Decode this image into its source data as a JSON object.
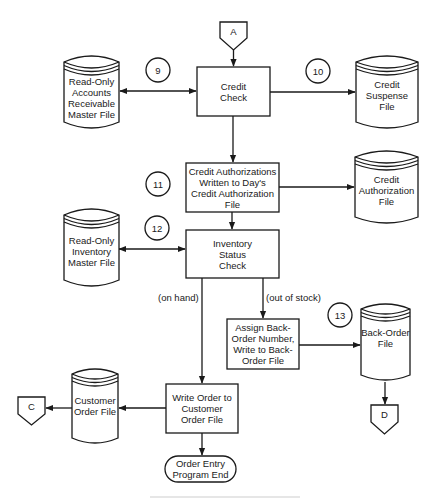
{
  "diagram": {
    "type": "system-flowchart",
    "connectors": {
      "A": {
        "label": "A",
        "role": "off-page entry"
      },
      "C": {
        "label": "C",
        "role": "off-page exit"
      },
      "D": {
        "label": "D",
        "role": "off-page exit"
      }
    },
    "processes": [
      {
        "id": "credit_check",
        "label": "Credit\nCheck"
      },
      {
        "id": "credit_auth_write",
        "label": "Credit Authorizations\nWritten to Day's\nCredit Authorization\nFile"
      },
      {
        "id": "inventory_check",
        "label": "Inventory\nStatus\nCheck"
      },
      {
        "id": "assign_backorder",
        "label": "Assign Back-\nOrder Number,\nWrite to Back-\nOrder File"
      },
      {
        "id": "write_order",
        "label": "Write Order\nto Customer\nOrder File"
      }
    ],
    "files": [
      {
        "id": "ar_master",
        "label": "Read-Only\nAccounts\nReceivable\nMaster File"
      },
      {
        "id": "credit_suspense",
        "label": "Credit\nSuspense\nFile"
      },
      {
        "id": "credit_auth_file",
        "label": "Credit\nAuthorization\nFile"
      },
      {
        "id": "inventory_master",
        "label": "Read-Only\nInventory\nMaster File"
      },
      {
        "id": "backorder_file",
        "label": "Back-Order\nFile"
      },
      {
        "id": "customer_order_file",
        "label": "Customer\nOrder\nFile"
      }
    ],
    "terminal": {
      "label": "Order Entry\nProgram End"
    },
    "step_numbers": [
      "9",
      "10",
      "11",
      "12",
      "13"
    ],
    "branch_labels": {
      "on_hand": "(on hand)",
      "out_of_stock": "(out of stock)"
    },
    "edges": [
      {
        "from": "A",
        "to": "credit_check"
      },
      {
        "from": "credit_check",
        "to": "ar_master",
        "bidirectional": true,
        "step": "9"
      },
      {
        "from": "credit_check",
        "to": "credit_suspense",
        "step": "10"
      },
      {
        "from": "credit_check",
        "to": "credit_auth_write"
      },
      {
        "from": "credit_auth_write",
        "to": "credit_auth_file",
        "step": "11"
      },
      {
        "from": "credit_auth_write",
        "to": "inventory_check"
      },
      {
        "from": "inventory_check",
        "to": "inventory_master",
        "bidirectional": true,
        "step": "12"
      },
      {
        "from": "inventory_check",
        "to": "write_order",
        "label": "(on hand)"
      },
      {
        "from": "inventory_check",
        "to": "assign_backorder",
        "label": "(out of stock)"
      },
      {
        "from": "assign_backorder",
        "to": "backorder_file",
        "step": "13"
      },
      {
        "from": "backorder_file",
        "to": "D"
      },
      {
        "from": "write_order",
        "to": "customer_order_file"
      },
      {
        "from": "customer_order_file",
        "to": "C"
      },
      {
        "from": "write_order",
        "to": "terminal"
      }
    ]
  },
  "labels": {
    "A": "A",
    "C": "C",
    "D": "D",
    "credit_check": "Credit Check",
    "credit_auth_write": "Credit Authorizations Written to Day's Credit Authorization File",
    "inventory_check": "Inventory Status Check",
    "assign_backorder": "Assign Back-Order Number, Write to Back-Order File",
    "write_order": "Write Order to Customer Order File",
    "ar_master": "Read-Only Accounts Receivable Master File",
    "credit_suspense": "Credit Suspense File",
    "credit_auth_file": "Credit Authorization File",
    "inventory_master": "Read-Only Inventory Master File",
    "backorder_file": "Back-Order File",
    "customer_order_file": "Customer Order File",
    "terminal": "Order Entry Program End",
    "on_hand": "(on hand)",
    "out_of_stock": "(out of stock)",
    "n9": "9",
    "n10": "10",
    "n11": "11",
    "n12": "12",
    "n13": "13"
  },
  "colors": {
    "stroke": "#1a1a1a",
    "background": "#ffffff"
  }
}
